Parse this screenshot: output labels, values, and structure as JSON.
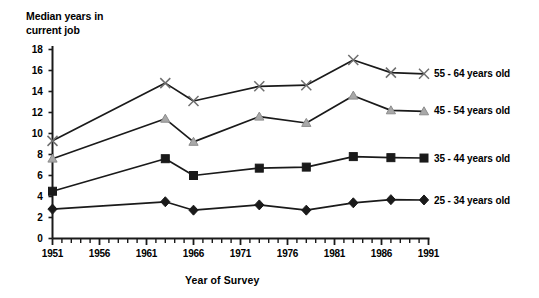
{
  "chart_data": {
    "type": "line",
    "title": "",
    "ylabel": "Median years in\ncurrent job",
    "xlabel": "Year of Survey",
    "ylim": [
      0,
      18
    ],
    "xlim": [
      1951,
      1991
    ],
    "grid": false,
    "legend_position": "right",
    "y_ticks": [
      0,
      2,
      4,
      6,
      8,
      10,
      12,
      14,
      16,
      18
    ],
    "y_tick_labels": [
      "0",
      "2",
      "4",
      "6",
      "8",
      "10",
      "12",
      "14",
      "16",
      "18"
    ],
    "x_ticks": [
      1951,
      1956,
      1961,
      1966,
      1971,
      1976,
      1981,
      1986,
      1991
    ],
    "x_tick_labels": [
      "1951",
      "1956",
      "1961",
      "1966",
      "1971",
      "1976",
      "1981",
      "1986",
      "1991"
    ],
    "x_minor_tick_interval": 1,
    "series": [
      {
        "name": "55 - 64 years old",
        "marker": "x",
        "color": "#1a1a1a",
        "x": [
          1951,
          1963,
          1966,
          1973,
          1978,
          1983,
          1987
        ],
        "values": [
          9.3,
          14.8,
          13.1,
          14.5,
          14.6,
          17.0,
          15.8
        ]
      },
      {
        "name": "45 - 54 years old",
        "marker": "triangle",
        "color": "#1a1a1a",
        "x": [
          1951,
          1963,
          1966,
          1973,
          1978,
          1983,
          1987
        ],
        "values": [
          7.6,
          11.4,
          9.2,
          11.6,
          11.0,
          13.6,
          12.2
        ]
      },
      {
        "name": "35 - 44 years old",
        "marker": "square",
        "color": "#1a1a1a",
        "x": [
          1951,
          1963,
          1966,
          1973,
          1978,
          1983,
          1987
        ],
        "values": [
          4.5,
          7.6,
          6.0,
          6.7,
          6.8,
          7.8,
          7.7
        ]
      },
      {
        "name": "25 - 34 years old",
        "marker": "diamond",
        "color": "#1a1a1a",
        "x": [
          1951,
          1963,
          1966,
          1973,
          1978,
          1983,
          1987
        ],
        "values": [
          2.8,
          3.5,
          2.7,
          3.2,
          2.7,
          3.4,
          3.7
        ]
      }
    ],
    "legend": [
      {
        "label": "55 - 64 years old",
        "marker": "x"
      },
      {
        "label": "45 - 54 years old",
        "marker": "triangle"
      },
      {
        "label": "35 - 44 years old",
        "marker": "square"
      },
      {
        "label": "25 - 34 years old",
        "marker": "diamond"
      }
    ]
  }
}
